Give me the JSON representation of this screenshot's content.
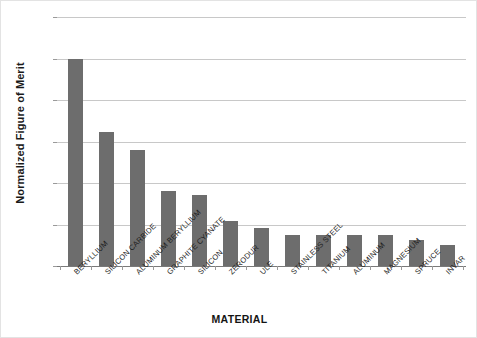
{
  "chart_data": {
    "type": "bar",
    "title": "",
    "xlabel": "MATERIAL",
    "ylabel": "Normalized Figure of Merit",
    "ylim": [
      0.0,
      1.2
    ],
    "ytick_step": 0.2,
    "ytick_labels": [
      "1.20",
      "1.00",
      "0.80",
      "0.60",
      "0.40",
      "0.20",
      "0.00"
    ],
    "ytick_values": [
      1.2,
      1.0,
      0.8,
      0.6,
      0.4,
      0.2,
      0.0
    ],
    "grid": "horizontal",
    "legend": "none",
    "bar_color": "#6d6d6d",
    "grid_color": "#c8c8c8",
    "axis_color": "#7a7a7a",
    "categories": [
      "BERYLLIUM",
      "SILICON CARBIDE",
      "ALUMINUM BERYLLIUM",
      "GRAPHITE CYANATE",
      "SILICON",
      "ZERODUR",
      "ULE",
      "STAINLESS STEEL",
      "TITANIUM",
      "ALUMINUM",
      "MAGNESIUM",
      "SPRUCE",
      "INVAR"
    ],
    "values": [
      1.0,
      0.645,
      0.56,
      0.36,
      0.34,
      0.215,
      0.185,
      0.15,
      0.15,
      0.15,
      0.15,
      0.125,
      0.1
    ]
  }
}
